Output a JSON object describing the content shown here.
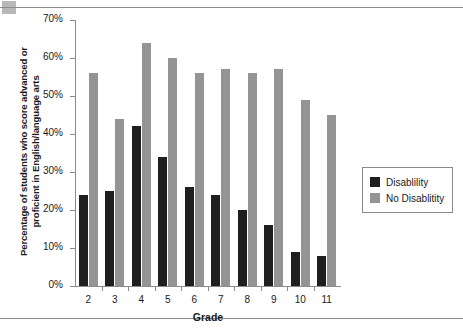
{
  "figure": {
    "corner_mark": "gray-square-marker",
    "top_rule": "horizontal-divider",
    "bottom_rule": "horizontal-divider"
  },
  "chart_data": {
    "type": "bar",
    "title": "",
    "xlabel": "Grade",
    "ylabel_line1": "Percentage of students who score advanced or",
    "ylabel_line2": "proficient in English/language arts",
    "categories": [
      "2",
      "3",
      "4",
      "5",
      "6",
      "7",
      "8",
      "9",
      "10",
      "11"
    ],
    "series": [
      {
        "name": "Disablility",
        "color": "#1f1f1f",
        "values": [
          24,
          25,
          42,
          34,
          26,
          24,
          20,
          16,
          9,
          8
        ]
      },
      {
        "name": "No Disablitity",
        "color": "#949494",
        "values": [
          56,
          44,
          64,
          60,
          56,
          57,
          56,
          57,
          49,
          45
        ]
      }
    ],
    "ylim": [
      0,
      70
    ],
    "ytick_values": [
      0,
      10,
      20,
      30,
      40,
      50,
      60,
      70
    ],
    "ytick_labels": [
      "0%",
      "10%",
      "20%",
      "30%",
      "40%",
      "50%",
      "60%",
      "70%"
    ],
    "grid": false,
    "legend_position": "right"
  }
}
